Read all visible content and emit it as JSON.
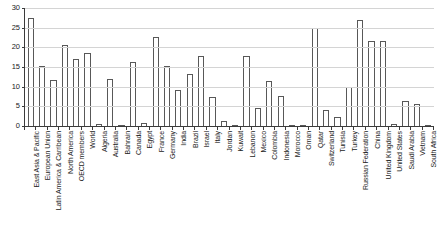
{
  "chart_data": {
    "type": "bar",
    "title": "",
    "subtitle": "",
    "xlabel": "",
    "ylabel": "",
    "ylim": [
      0,
      30
    ],
    "yticks": [
      0,
      5,
      10,
      15,
      20,
      25,
      30
    ],
    "grid": true,
    "legend": false,
    "legend_position": "none",
    "bar_fill_color": "#ffffff",
    "bar_edge_color": "#585858",
    "axis_color": "#3b3b3b",
    "grid_color": "#d4d4d4",
    "categories": [
      "East Asia & Pacific",
      "European Union",
      "Latin America & Carribean",
      "North America",
      "OECD members",
      "World",
      "Algeria",
      "Australia",
      "Bahrain",
      "Canada",
      "Egypt",
      "France",
      "Germany",
      "India",
      "Brazil",
      "Israel",
      "Italy",
      "Jordan",
      "Kuwait",
      "Lebanon",
      "Mexico",
      "Colombia",
      "Indonesia",
      "Morocco",
      "Oman",
      "Qatar",
      "Switzerland",
      "Tunisia",
      "Turkey",
      "Russian Federation",
      "China",
      "United Kingdom",
      "United States",
      "Saudi Arabia",
      "Vietnam",
      "South Africa"
    ],
    "values": [
      27.5,
      15.3,
      11.6,
      20.5,
      17.1,
      18.5,
      0.5,
      12.0,
      0.1,
      16.2,
      0.8,
      22.7,
      15.2,
      9.2,
      13.3,
      17.7,
      7.5,
      1.2,
      0.3,
      17.8,
      4.7,
      11.5,
      7.7,
      0.3,
      0.1,
      25.0,
      4.0,
      2.3,
      10.0,
      27.0,
      21.7,
      21.5,
      0.4,
      6.3,
      5.6,
      0.0
    ],
    "series": [
      {
        "name": "value",
        "values": [
          27.5,
          15.3,
          11.6,
          20.5,
          17.1,
          18.5,
          0.5,
          12.0,
          0.1,
          16.2,
          0.8,
          22.7,
          15.2,
          9.2,
          13.3,
          17.7,
          7.5,
          1.2,
          0.3,
          17.8,
          4.7,
          11.5,
          7.7,
          0.3,
          0.1,
          25.0,
          4.0,
          2.3,
          10.0,
          27.0,
          21.7,
          21.5,
          0.4,
          6.3,
          5.6,
          0.0
        ]
      }
    ]
  }
}
